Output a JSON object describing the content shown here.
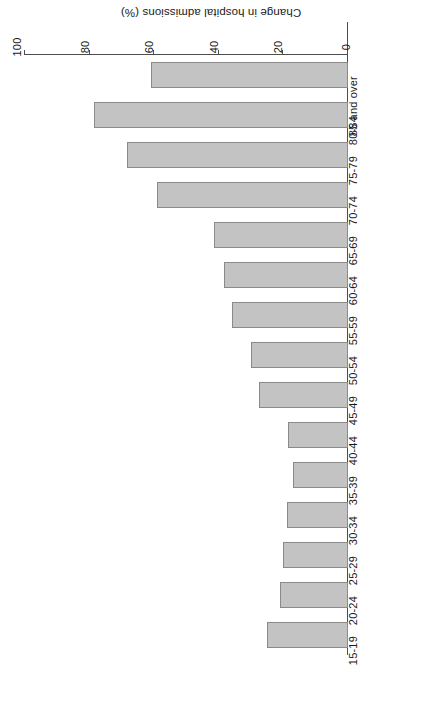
{
  "chart_data": {
    "type": "bar",
    "orientation": "horizontal",
    "title": "",
    "subtitle": "",
    "xlabel": "Change in hospital admissions (%)",
    "ylabel": "",
    "categories": [
      "15-19",
      "20-24",
      "25-29",
      "30-34",
      "35-39",
      "40-44",
      "45-49",
      "50-54",
      "55-59",
      "60-64",
      "65-69",
      "70-74",
      "75-79",
      "80-84",
      "85 and over"
    ],
    "values": [
      25,
      21,
      20,
      19,
      17,
      18.5,
      27.5,
      30,
      36,
      38.5,
      41.5,
      59,
      68.5,
      78.5,
      61
    ],
    "xlim": [
      0,
      100
    ],
    "xticks": [
      0,
      20,
      40,
      60,
      80,
      100
    ],
    "xtick_labels": [
      "0",
      "20",
      "40",
      "60",
      "80",
      "100"
    ],
    "grid": false,
    "legend": null,
    "bar_color": "#c3c3c3",
    "bar_edge_color": "#8a8a8a",
    "axis_color": "#4d4d4d",
    "background": "#ffffff",
    "rotation_deg": 180
  },
  "figure": {
    "axis_title": "Change in hospital admissions (%)"
  }
}
